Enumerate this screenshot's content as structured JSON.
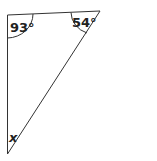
{
  "diagram": {
    "type": "triangle",
    "angles": {
      "top_left": "93°",
      "top_right": "54°",
      "bottom": "x"
    },
    "colors": {
      "line": "#333333",
      "background": "#ffffff"
    }
  }
}
